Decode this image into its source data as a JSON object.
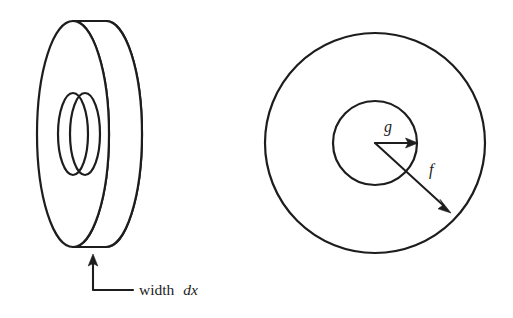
{
  "figure": {
    "background_color": "#ffffff",
    "ink_color": "#1d1d1d",
    "width": 513,
    "height": 318
  },
  "left_diagram": {
    "name": "tilted-washer-3d",
    "description": "Three-dimensional washer (disk with circular hole) drawn in oblique view showing its thickness",
    "annotation": {
      "label_plain": "width",
      "label_variable": "dx",
      "full_text": "width dx",
      "leader": {
        "arrow_tip": [
          93,
          256
        ],
        "arrow_base": [
          93,
          290
        ],
        "elbow": [
          93,
          290
        ],
        "end": [
          133,
          290
        ]
      }
    },
    "geometry": {
      "outer_front_center": [
        73,
        134
      ],
      "outer_radius_x": 36,
      "outer_radius_y": 113,
      "thickness_offset": 33,
      "hole_front_center": [
        73,
        134
      ],
      "hole_radius_x": 15,
      "hole_radius_y": 41,
      "hole_offset": 12
    }
  },
  "right_diagram": {
    "name": "annulus-top-view",
    "description": "Top view of the washer as two concentric circles with radius arrows labelled f and g",
    "geometry": {
      "center": [
        375,
        143
      ],
      "outer_radius": 110,
      "inner_radius": 42
    },
    "arrows": [
      {
        "name": "inner-radius-arrow",
        "label": "g",
        "label_position": [
          385,
          130
        ],
        "from": [
          375,
          143
        ],
        "to": [
          417,
          143
        ],
        "meaning": "inner radius"
      },
      {
        "name": "outer-radius-arrow",
        "label": "f",
        "label_position": [
          431,
          173
        ],
        "from": [
          375,
          143
        ],
        "to": [
          450,
          212
        ],
        "meaning": "outer radius"
      }
    ]
  }
}
